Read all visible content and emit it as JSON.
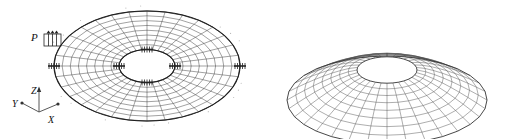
{
  "figure": {
    "name": "annular-plate-fem-mesh",
    "background_color": "#ffffff",
    "line_color": "#2b2b2b",
    "panels": [
      {
        "id": "undeformed",
        "caption": "",
        "description": "undeformed annular plate finite element mesh with pressure load, edge supports and coordinate triad"
      },
      {
        "id": "deformed",
        "caption": "",
        "description": "deformed annular plate mesh showing out-of-plane dishing"
      }
    ]
  },
  "annotations": {
    "load_label": "P",
    "axes": {
      "z_label": "Z",
      "y_label": "Y",
      "x_label": "X"
    }
  },
  "mesh": {
    "radial_divisions": 8,
    "circumferential_divisions": 32,
    "outer_radius_ratio": 1.0,
    "inner_radius_ratio": 0.3
  },
  "supports": {
    "count": 4,
    "outer_positions": [
      "left",
      "right"
    ],
    "inner_positions": [
      "top",
      "bottom",
      "left",
      "right"
    ]
  }
}
